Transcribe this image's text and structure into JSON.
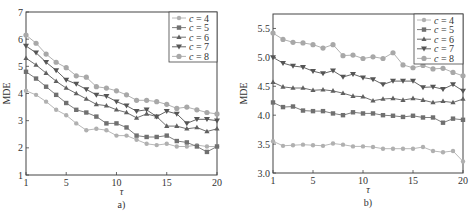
{
  "chart_data": [
    {
      "type": "line",
      "panel_label": "a)",
      "title": "",
      "xlabel": "τ",
      "ylabel": "MDE",
      "xlim": [
        1,
        20
      ],
      "ylim": [
        1,
        7
      ],
      "xticks": [
        1,
        5,
        10,
        15,
        20
      ],
      "yticks": [
        1,
        2,
        3,
        4,
        5,
        6,
        7
      ],
      "grid": false,
      "legend_position": "upper right",
      "x": [
        1,
        2,
        3,
        4,
        5,
        6,
        7,
        8,
        9,
        10,
        11,
        12,
        13,
        14,
        15,
        16,
        17,
        18,
        19,
        20
      ],
      "series": [
        {
          "name": "c = 4",
          "marker": "plus",
          "color": "#b0b0b0",
          "values": [
            4.1,
            3.95,
            3.7,
            3.4,
            3.2,
            2.9,
            2.65,
            2.7,
            2.65,
            2.45,
            2.45,
            2.3,
            2.15,
            2.1,
            2.15,
            2.05,
            2.05,
            2.1,
            2.05,
            2.05
          ]
        },
        {
          "name": "c = 5",
          "marker": "square",
          "color": "#707070",
          "values": [
            4.8,
            4.55,
            4.25,
            3.95,
            3.65,
            3.4,
            3.3,
            3.15,
            2.9,
            2.9,
            2.75,
            2.45,
            2.4,
            2.4,
            2.45,
            2.25,
            2.2,
            2.05,
            1.85,
            2.05
          ]
        },
        {
          "name": "c = 6",
          "marker": "star",
          "color": "#606060",
          "values": [
            5.3,
            5.05,
            4.75,
            4.45,
            4.2,
            4.0,
            3.8,
            3.6,
            3.55,
            3.4,
            3.3,
            3.1,
            3.25,
            3.15,
            2.8,
            2.8,
            2.7,
            2.75,
            2.6,
            2.7
          ]
        },
        {
          "name": "c = 7",
          "marker": "triangle-down",
          "color": "#555555",
          "values": [
            5.75,
            5.5,
            5.15,
            4.85,
            4.5,
            4.35,
            4.15,
            3.95,
            3.9,
            3.7,
            3.55,
            3.35,
            3.4,
            3.15,
            3.35,
            3.25,
            2.9,
            3.05,
            3.05,
            3.0
          ]
        },
        {
          "name": "c = 8",
          "marker": "circle",
          "color": "#a8a8a8",
          "values": [
            6.15,
            5.85,
            5.45,
            5.15,
            4.95,
            4.65,
            4.6,
            4.25,
            4.2,
            4.1,
            3.95,
            3.75,
            3.75,
            3.7,
            3.6,
            3.45,
            3.5,
            3.4,
            3.3,
            3.25
          ]
        }
      ]
    },
    {
      "type": "line",
      "panel_label": "b)",
      "title": "",
      "xlabel": "τ",
      "ylabel": "MDE",
      "xlim": [
        1,
        20
      ],
      "ylim": [
        3.0,
        5.75
      ],
      "xticks": [
        1,
        5,
        10,
        15,
        20
      ],
      "yticks": [
        3.0,
        3.5,
        4.0,
        4.5,
        5.0,
        5.5
      ],
      "ytick_labels": [
        "3.0",
        "3.5",
        "4.0",
        "4.5",
        "5.0",
        "5.5"
      ],
      "grid": false,
      "legend_position": "upper right",
      "x": [
        1,
        2,
        3,
        4,
        5,
        6,
        7,
        8,
        9,
        10,
        11,
        12,
        13,
        14,
        15,
        16,
        17,
        18,
        19,
        20
      ],
      "series": [
        {
          "name": "c = 4",
          "marker": "plus",
          "color": "#b0b0b0",
          "values": [
            3.55,
            3.47,
            3.48,
            3.49,
            3.48,
            3.47,
            3.51,
            3.49,
            3.46,
            3.46,
            3.45,
            3.42,
            3.42,
            3.42,
            3.42,
            3.45,
            3.38,
            3.36,
            3.38,
            3.2
          ]
        },
        {
          "name": "c = 5",
          "marker": "square",
          "color": "#707070",
          "values": [
            4.22,
            4.14,
            4.15,
            4.08,
            4.07,
            4.07,
            4.03,
            4.0,
            4.05,
            4.03,
            4.03,
            4.0,
            3.99,
            3.97,
            3.99,
            3.96,
            3.96,
            3.87,
            3.94,
            3.92
          ]
        },
        {
          "name": "c = 6",
          "marker": "star",
          "color": "#606060",
          "values": [
            4.57,
            4.49,
            4.47,
            4.47,
            4.43,
            4.44,
            4.42,
            4.38,
            4.33,
            4.32,
            4.25,
            4.28,
            4.29,
            4.26,
            4.29,
            4.26,
            4.22,
            4.24,
            4.22,
            4.28
          ]
        },
        {
          "name": "c = 7",
          "marker": "triangle-down",
          "color": "#555555",
          "values": [
            5.0,
            4.9,
            4.85,
            4.83,
            4.76,
            4.72,
            4.77,
            4.66,
            4.71,
            4.65,
            4.62,
            4.53,
            4.59,
            4.59,
            4.59,
            4.48,
            4.49,
            4.45,
            4.53,
            4.42
          ]
        },
        {
          "name": "c = 8",
          "marker": "circle",
          "color": "#a8a8a8",
          "values": [
            5.42,
            5.31,
            5.26,
            5.25,
            5.22,
            5.16,
            5.22,
            5.03,
            5.04,
            4.98,
            5.01,
            4.98,
            5.08,
            4.87,
            4.82,
            4.86,
            4.8,
            4.81,
            4.74,
            4.68
          ]
        }
      ]
    }
  ],
  "panels": [
    {
      "label": "a)",
      "xlabel": "τ",
      "ylabel": "MDE"
    },
    {
      "label": "b)",
      "xlabel": "τ",
      "ylabel": "MDE"
    }
  ]
}
